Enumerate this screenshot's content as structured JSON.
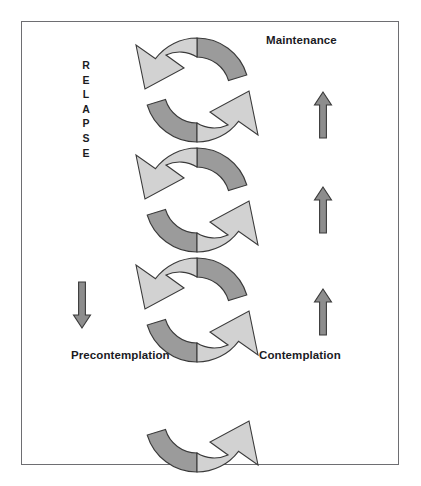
{
  "figure": {
    "background_color": "#ffffff",
    "frame": {
      "border_color": "#6e6e72",
      "fill_color": "#ffffff"
    },
    "colors": {
      "light_arrow_fill": "#d2d2d2",
      "dark_arrow_fill": "#9b9b9b",
      "straight_arrow_fill": "#8d8d8d",
      "outline": "#3a3a3a",
      "text": "#1b1b1f"
    }
  },
  "labels": {
    "maintenance": "Maintenance",
    "precontemplation": "Precontemplation",
    "contemplation": "Contemplation",
    "relapse": "RELAPSE",
    "relapse_letters": [
      "R",
      "E",
      "L",
      "A",
      "P",
      "S",
      "E"
    ]
  },
  "cycles": [
    {
      "index": 1,
      "center_y": 90,
      "light_arrow": "upper-left-curve-arrow-pointing-down-left",
      "dark_arrow": "upper-right-curve-dark",
      "lower_light_arrow": "lower-right-curve-arrow-pointing-up-right",
      "lower_dark_arrow": "lower-left-curve-dark"
    },
    {
      "index": 2,
      "center_y": 200,
      "light_arrow": "upper-left-curve-arrow-pointing-down-left",
      "dark_arrow": "upper-right-curve-dark",
      "lower_light_arrow": "lower-right-curve-arrow-pointing-up-right",
      "lower_dark_arrow": "lower-left-curve-dark"
    },
    {
      "index": 3,
      "center_y": 310,
      "light_arrow": "upper-left-curve-arrow-pointing-down-left",
      "dark_arrow": "upper-right-curve-dark",
      "lower_light_arrow": "lower-right-curve-arrow-pointing-up-right",
      "lower_dark_arrow": "lower-left-curve-dark"
    },
    {
      "index": 4,
      "center_y": 420,
      "partial": "bottom-half-only",
      "lower_light_arrow": "lower-right-curve-arrow-pointing-up-right",
      "lower_dark_arrow": "lower-left-curve-dark"
    }
  ],
  "straight_arrows": [
    {
      "name": "up-arrow-1",
      "direction": "up",
      "x": 323,
      "top": 92,
      "height": 48
    },
    {
      "name": "up-arrow-2",
      "direction": "up",
      "x": 323,
      "top": 185,
      "height": 43
    },
    {
      "name": "up-arrow-3",
      "direction": "up",
      "x": 323,
      "top": 288,
      "height": 45
    },
    {
      "name": "down-arrow-relapse",
      "direction": "down",
      "x": 82,
      "top": 278,
      "height": 53
    }
  ]
}
